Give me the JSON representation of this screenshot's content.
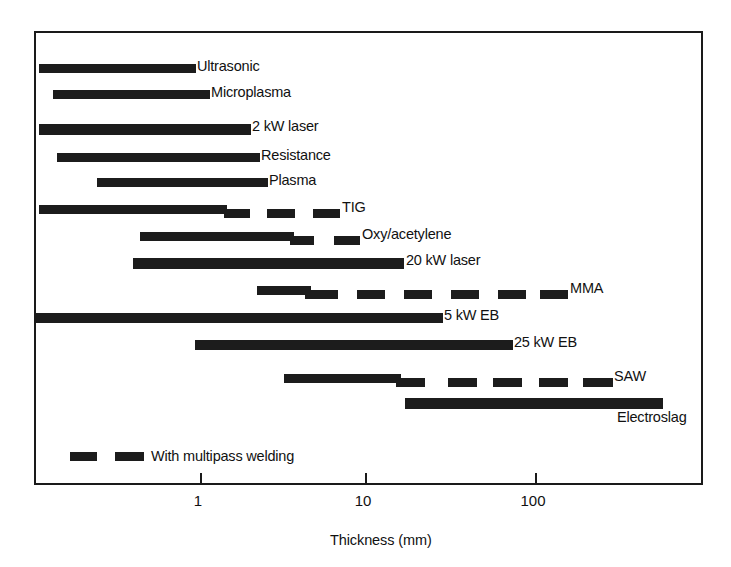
{
  "chart_data": {
    "type": "bar",
    "title": "",
    "xlabel": "Thickness (mm)",
    "ylabel": "",
    "scale": "log",
    "xlim": [
      0.08,
      900
    ],
    "grid": false,
    "tick_labels": [
      "1",
      "10",
      "100"
    ],
    "tick_values": [
      1,
      10,
      100
    ],
    "legend": {
      "label": "With multipass welding",
      "style": "dashed-bar"
    },
    "categories": [
      "Ultrasonic",
      "Microplasma",
      "2 kW laser",
      "Resistance",
      "Plasma",
      "TIG",
      "Oxy/acetylene",
      "20 kW laser",
      "MMA",
      "5 kW EB",
      "25 kW EB",
      "SAW",
      "Electroslag"
    ],
    "series": [
      {
        "name": "Ultrasonic",
        "range_mm": [
          0.1,
          0.83
        ],
        "multipass_range_mm": null
      },
      {
        "name": "Microplasma",
        "range_mm": [
          0.14,
          1.1
        ],
        "multipass_range_mm": null
      },
      {
        "name": "2 kW laser",
        "range_mm": [
          0.1,
          2.0
        ],
        "multipass_range_mm": null
      },
      {
        "name": "Resistance",
        "range_mm": [
          0.2,
          2.3
        ],
        "multipass_range_mm": null
      },
      {
        "name": "Plasma",
        "range_mm": [
          0.4,
          2.6
        ],
        "multipass_range_mm": null
      },
      {
        "name": "TIG",
        "range_mm": [
          0.1,
          1.9
        ],
        "multipass_range_mm": [
          1.9,
          6.0
        ]
      },
      {
        "name": "Oxy/acetylene",
        "range_mm": [
          0.55,
          3.8
        ],
        "multipass_range_mm": [
          3.8,
          8.0
        ]
      },
      {
        "name": "20 kW laser",
        "range_mm": [
          0.45,
          13.0
        ],
        "multipass_range_mm": null
      },
      {
        "name": "MMA",
        "range_mm": [
          2.5,
          6.3
        ],
        "multipass_range_mm": [
          6.3,
          85.0
        ]
      },
      {
        "name": "5 kW EB",
        "range_mm": [
          0.1,
          25.0
        ],
        "multipass_range_mm": null
      },
      {
        "name": "25 kW EB",
        "range_mm": [
          0.85,
          55.0
        ],
        "multipass_range_mm": null
      },
      {
        "name": "SAW",
        "range_mm": [
          3.3,
          15.0
        ],
        "multipass_range_mm": [
          15.0,
          150.0
        ]
      },
      {
        "name": "Electroslag",
        "range_mm": [
          16.0,
          400.0
        ],
        "multipass_range_mm": null
      }
    ]
  },
  "figure": {
    "rows": [
      {
        "label": "Ultrasonic",
        "label_x": 197,
        "top": 62,
        "segments": [
          {
            "x": 37,
            "w": 157,
            "y": 0,
            "h": 9
          }
        ]
      },
      {
        "label": "Microplasma",
        "label_x": 211,
        "top": 88,
        "segments": [
          {
            "x": 51,
            "w": 157,
            "y": 0,
            "h": 9
          }
        ]
      },
      {
        "label": "2 kW laser",
        "label_x": 252,
        "top": 122,
        "segments": [
          {
            "x": 37,
            "w": 212,
            "y": 0,
            "h": 11
          }
        ]
      },
      {
        "label": "Resistance",
        "label_x": 261,
        "top": 151,
        "segments": [
          {
            "x": 55,
            "w": 203,
            "y": 0,
            "h": 9
          }
        ]
      },
      {
        "label": "Plasma",
        "label_x": 269,
        "top": 176,
        "segments": [
          {
            "x": 95,
            "w": 171,
            "y": 0,
            "h": 9
          }
        ]
      },
      {
        "label": "TIG",
        "label_x": 342,
        "top": 203,
        "segments": [
          {
            "x": 37,
            "w": 188,
            "y": 0,
            "h": 9
          },
          {
            "x": 222,
            "w": 26,
            "y": 4,
            "h": 9
          },
          {
            "x": 265,
            "w": 28,
            "y": 4,
            "h": 9
          },
          {
            "x": 311,
            "w": 27,
            "y": 4,
            "h": 9
          }
        ]
      },
      {
        "label": "Oxy/acetylene",
        "label_x": 362,
        "top": 230,
        "segments": [
          {
            "x": 138,
            "w": 154,
            "y": 0,
            "h": 9
          },
          {
            "x": 288,
            "w": 24,
            "y": 4,
            "h": 9
          },
          {
            "x": 332,
            "w": 26,
            "y": 4,
            "h": 9
          }
        ]
      },
      {
        "label": "20 kW laser",
        "label_x": 406,
        "top": 256,
        "segments": [
          {
            "x": 131,
            "w": 271,
            "y": 0,
            "h": 11
          }
        ]
      },
      {
        "label": "MMA",
        "label_x": 570,
        "top": 284,
        "segments": [
          {
            "x": 255,
            "w": 54,
            "y": 0,
            "h": 9
          },
          {
            "x": 303,
            "w": 33,
            "y": 4,
            "h": 9
          },
          {
            "x": 355,
            "w": 28,
            "y": 4,
            "h": 9
          },
          {
            "x": 402,
            "w": 28,
            "y": 4,
            "h": 9
          },
          {
            "x": 449,
            "w": 28,
            "y": 4,
            "h": 9
          },
          {
            "x": 496,
            "w": 28,
            "y": 4,
            "h": 9
          },
          {
            "x": 538,
            "w": 28,
            "y": 4,
            "h": 9
          }
        ]
      },
      {
        "label": "5 kW EB",
        "label_x": 444,
        "top": 311,
        "segments": [
          {
            "x": 34,
            "w": 407,
            "y": 0,
            "h": 10
          }
        ]
      },
      {
        "label": "25 kW EB",
        "label_x": 514,
        "top": 338,
        "segments": [
          {
            "x": 193,
            "w": 318,
            "y": 0,
            "h": 10
          }
        ]
      },
      {
        "label": "SAW",
        "label_x": 614,
        "top": 372,
        "segments": [
          {
            "x": 282,
            "w": 117,
            "y": 0,
            "h": 9
          },
          {
            "x": 394,
            "w": 29,
            "y": 4,
            "h": 9
          },
          {
            "x": 446,
            "w": 29,
            "y": 4,
            "h": 9
          },
          {
            "x": 491,
            "w": 29,
            "y": 4,
            "h": 9
          },
          {
            "x": 537,
            "w": 29,
            "y": 4,
            "h": 9
          },
          {
            "x": 581,
            "w": 30,
            "y": 4,
            "h": 9
          }
        ]
      },
      {
        "label": "Electroslag",
        "label_x": 617,
        "top": 396,
        "label_below": true,
        "segments": [
          {
            "x": 403,
            "w": 258,
            "y": 0,
            "h": 11
          }
        ]
      }
    ],
    "ticks": [
      {
        "label": "1",
        "x": 198
      },
      {
        "label": "10",
        "x": 363
      },
      {
        "label": "100",
        "x": 533
      }
    ],
    "legend_segments": [
      {
        "x": 68,
        "w": 27
      },
      {
        "x": 113,
        "w": 29
      }
    ],
    "legend_label_x": 149,
    "legend_y": 450,
    "axis_title_x": 330,
    "axis_title_y": 532,
    "colors": {
      "bar": "#1c1c1c",
      "frame": "#1a1a1a",
      "text": "#111111",
      "background": "#ffffff"
    }
  }
}
